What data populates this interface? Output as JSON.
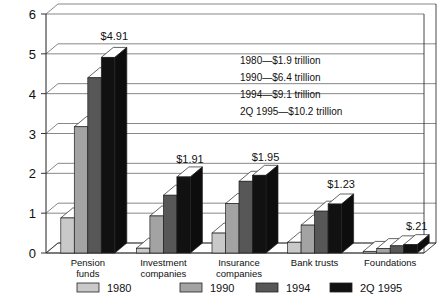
{
  "chart_data": {
    "type": "bar",
    "title": "",
    "subtitle": "",
    "xlabel": "",
    "ylabel": "",
    "ylim": [
      0,
      6
    ],
    "yticks": [
      0,
      1,
      2,
      3,
      4,
      5,
      6
    ],
    "ytick_labels": [
      "0",
      "1",
      "2",
      "3",
      "4",
      "5",
      "6"
    ],
    "grid": true,
    "grid_axis": "y",
    "legend_position": "bottom",
    "projection": "3d-bar",
    "categories": [
      "Pension funds",
      "Investment companies",
      "Insurance companies",
      "Bank trusts",
      "Foundations"
    ],
    "category_lines": [
      [
        "Pension",
        "funds"
      ],
      [
        "Investment",
        "companies"
      ],
      [
        "Insurance",
        "companies"
      ],
      [
        "Bank trusts",
        ""
      ],
      [
        "Foundations",
        ""
      ]
    ],
    "series": [
      {
        "name": "1980",
        "color": "#c9c9c9",
        "values": [
          0.88,
          0.12,
          0.5,
          0.27,
          0.04
        ]
      },
      {
        "name": "1990",
        "color": "#a3a3a3",
        "values": [
          3.17,
          0.93,
          1.24,
          0.7,
          0.11
        ]
      },
      {
        "name": "1994",
        "color": "#575757",
        "values": [
          4.4,
          1.45,
          1.8,
          1.05,
          0.18
        ]
      },
      {
        "name": "2Q 1995",
        "color": "#111111",
        "values": [
          4.91,
          1.91,
          1.95,
          1.23,
          0.21
        ]
      }
    ],
    "value_labels": [
      {
        "category": "Pension funds",
        "text": "$4.91"
      },
      {
        "category": "Investment companies",
        "text": "$1.91"
      },
      {
        "category": "Insurance companies",
        "text": "$1.95"
      },
      {
        "category": "Bank trusts",
        "text": "$1.23"
      },
      {
        "category": "Foundations",
        "text": "$.21"
      }
    ],
    "annotations": [
      "1980—$1.9 trillion",
      "1990—$6.4 trillion",
      "1994—$9.1 trillion",
      "2Q 1995—$10.2 trillion"
    ]
  },
  "axis": {
    "y_ticks": [
      "0",
      "1",
      "2",
      "3",
      "4",
      "5",
      "6"
    ]
  },
  "legend": {
    "items": [
      {
        "label": "1980"
      },
      {
        "label": "1990"
      },
      {
        "label": "1994"
      },
      {
        "label": "2Q 1995"
      }
    ]
  }
}
